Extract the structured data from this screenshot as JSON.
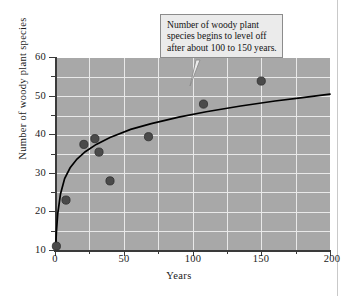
{
  "chart_data": {
    "type": "scatter",
    "title": "",
    "xlabel": "Years",
    "ylabel": "Number of woody plant species",
    "xlim": [
      0,
      200
    ],
    "ylim": [
      10,
      60
    ],
    "xticks": [
      0,
      50,
      100,
      150,
      200
    ],
    "xticklabels": [
      "0",
      "50",
      "100",
      "150",
      "200"
    ],
    "xminor_step": 25,
    "yticks": [
      10,
      20,
      30,
      40,
      50,
      60
    ],
    "yticklabels": [
      "10",
      "20",
      "30",
      "40",
      "50",
      "60"
    ],
    "yminor_step": 5,
    "grid": true,
    "legend": "none",
    "plot_background": "#a8a8a8",
    "grid_color": "#e9e9e9",
    "marker_color": "#4a4a4a",
    "curve_color": "#000000",
    "points": [
      {
        "x": 1,
        "y": 11
      },
      {
        "x": 8,
        "y": 23
      },
      {
        "x": 21,
        "y": 37.5
      },
      {
        "x": 29,
        "y": 39
      },
      {
        "x": 32,
        "y": 35.5
      },
      {
        "x": 40,
        "y": 28
      },
      {
        "x": 68,
        "y": 39.5
      },
      {
        "x": 108,
        "y": 48
      },
      {
        "x": 150,
        "y": 54
      }
    ],
    "fit_curve": {
      "description": "logarithmic trend curve rising steeply then leveling off",
      "x": [
        0.4,
        1,
        2,
        4,
        7,
        11,
        16,
        22,
        30,
        40,
        55,
        70,
        90,
        110,
        135,
        160,
        180,
        200
      ],
      "y": [
        10.2,
        14.6,
        19.5,
        24.6,
        28.6,
        31.4,
        33.7,
        35.6,
        37.5,
        39.3,
        41.4,
        42.9,
        44.6,
        46.0,
        47.5,
        48.8,
        49.7,
        50.6
      ]
    },
    "annotations": [
      {
        "name": "level-off-callout",
        "lines": [
          "Number of woody plant",
          "species begins to level off",
          "after about 100 to 150 years."
        ],
        "points_to": {
          "x": 105,
          "y": 46
        }
      }
    ]
  },
  "axes": {
    "x_title": "Years",
    "y_title": "Number of woody plant species"
  }
}
